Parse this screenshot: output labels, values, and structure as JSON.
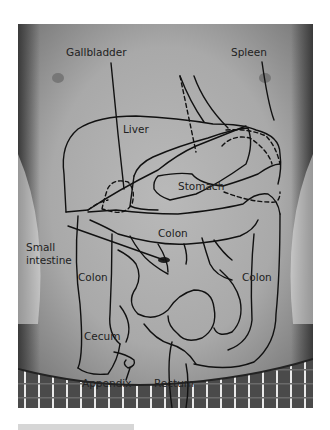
{
  "figure": {
    "labels": {
      "gallbladder": "Gallbladder",
      "spleen": "Spleen",
      "liver": "Liver",
      "stomach": "Stomach",
      "colon_transverse": "Colon",
      "small_intestine_line1": "Small",
      "small_intestine_line2": "intestine",
      "colon_ascending": "Colon",
      "colon_descending": "Colon",
      "cecum": "Cecum",
      "appendix": "Appendix",
      "rectum": "Rectum"
    },
    "colors": {
      "outline": "#111111",
      "label_text": "#222222",
      "background": "#ffffff",
      "caption_bar": "#d6d6d6"
    }
  }
}
